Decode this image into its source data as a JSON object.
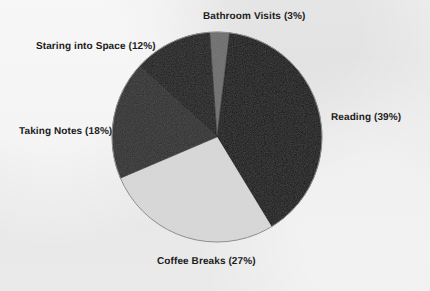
{
  "chart_data": {
    "type": "pie",
    "title": "",
    "subtitle": "",
    "xlabel": "",
    "ylabel": "",
    "legend_position": "none",
    "grid": false,
    "units": "percent",
    "start_angle_deg": -4,
    "direction": "clockwise",
    "categories": [
      "Bathroom Visits",
      "Reading",
      "Coffee Breaks",
      "Taking Notes",
      "Staring into Space"
    ],
    "values": [
      3,
      39,
      27,
      18,
      12
    ],
    "slices": [
      {
        "name": "Bathroom Visits",
        "value": 3,
        "label": "Bathroom Visits (3%)",
        "color": "#6e6e6e"
      },
      {
        "name": "Reading",
        "value": 39,
        "label": "Reading (39%)",
        "color": "#141414"
      },
      {
        "name": "Coffee Breaks",
        "value": 27,
        "label": "Coffee Breaks (27%)",
        "color": "#d8d8d8"
      },
      {
        "name": "Taking Notes",
        "value": 18,
        "label": "Taking Notes (18%)",
        "color": "#2e2e2e"
      },
      {
        "name": "Staring into Space",
        "value": 12,
        "label": "Staring into Space (12%)",
        "color": "#1a1a1a"
      }
    ],
    "background_color": "#e9e9e9",
    "label_color": "#1b1b1b",
    "outline_color": "#8f8f8f"
  },
  "labels": {
    "bathroom": "Bathroom Visits (3%)",
    "staring": "Staring into Space (12%)",
    "taking_notes": "Taking Notes (18%)",
    "reading": "Reading (39%)",
    "coffee": "Coffee Breaks (27%)"
  }
}
